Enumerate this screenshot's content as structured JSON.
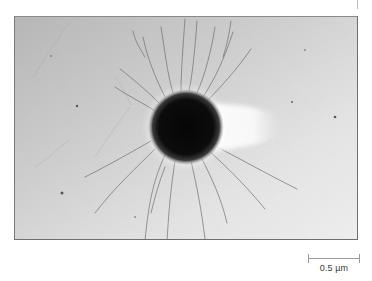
{
  "figure": {
    "type": "micrograph",
    "colors": {
      "background_top_left": "#b9b9b9",
      "background_bottom_right": "#f0f0f0",
      "particle": "#0a0a0a",
      "tail": "#fbfbfb",
      "crack": "#6a6a6a",
      "frame": "#6f6f6f"
    }
  },
  "scale_bar": {
    "label": "0.5 µm",
    "length_px": 51
  }
}
